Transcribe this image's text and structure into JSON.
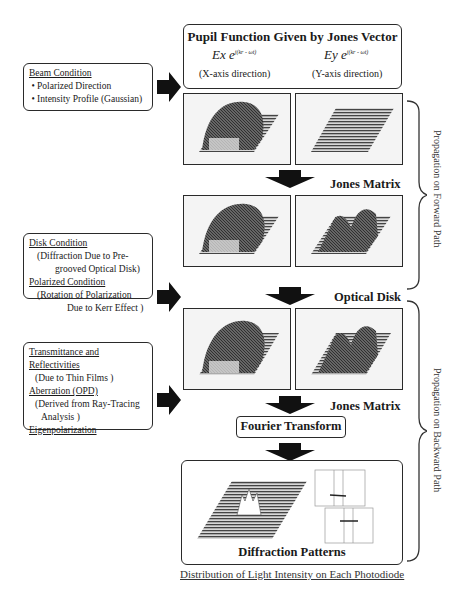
{
  "pupil_box": {
    "title": "Pupil Function Given by Jones Vector",
    "ex_label": "Ex",
    "ex_exp": "j(kr - ωt)",
    "ey_label": "Ey",
    "ey_exp": "j(kr - ωt)",
    "x_dir": "(X-axis direction)",
    "y_dir": "(Y-axis direction)"
  },
  "beam_box": {
    "heading": "Beam Condition",
    "items": [
      "Polarized Direction",
      "Intensity Profile (Gaussian)"
    ]
  },
  "disk_box": {
    "heading1": "Disk Condition",
    "text1a": "(Diffraction Due to Pre-",
    "text1b": "grooved Optical Disk)",
    "heading2": "Polarized Condition",
    "text2a": "(Rotation of Polarization",
    "text2b": "Due to Kerr Effect )"
  },
  "film_box": {
    "heading1": "Transmittance and Reflectivities",
    "text1": "(Due to Thin Films )",
    "heading2": "Aberration (OPD)",
    "text2a": "(Derived from Ray-Tracing",
    "text2b": "Analysis )",
    "heading3": "Eigenpolarization"
  },
  "steps": {
    "jones_matrix_1": "Jones Matrix",
    "optical_disk": "Optical Disk",
    "jones_matrix_2": "Jones Matrix",
    "fourier_transform": "Fourier Transform",
    "diffraction_patterns": "Diffraction Patterns"
  },
  "side_labels": {
    "forward": "Propagation on Forward Path",
    "backward": "Propagation on Backward Path"
  },
  "caption": "Distribution of Light Intensity on Each Photodiode",
  "colors": {
    "line": "#2a2a2a",
    "panel_bg": "#f4f4f4",
    "plot_dark": "#3a3a3a"
  }
}
